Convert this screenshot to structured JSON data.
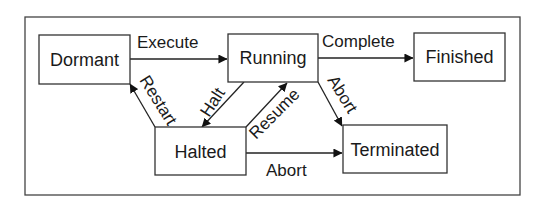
{
  "diagram": {
    "type": "state-diagram",
    "states": [
      {
        "id": "dormant",
        "label": "Dormant"
      },
      {
        "id": "running",
        "label": "Running"
      },
      {
        "id": "finished",
        "label": "Finished"
      },
      {
        "id": "halted",
        "label": "Halted"
      },
      {
        "id": "terminated",
        "label": "Terminated"
      }
    ],
    "transitions": [
      {
        "from": "dormant",
        "to": "running",
        "label": "Execute"
      },
      {
        "from": "running",
        "to": "finished",
        "label": "Complete"
      },
      {
        "from": "running",
        "to": "halted",
        "label": "Halt"
      },
      {
        "from": "halted",
        "to": "running",
        "label": "Resume"
      },
      {
        "from": "halted",
        "to": "dormant",
        "label": "Restart"
      },
      {
        "from": "running",
        "to": "terminated",
        "label": "Abort"
      },
      {
        "from": "halted",
        "to": "terminated",
        "label": "Abort"
      }
    ]
  }
}
